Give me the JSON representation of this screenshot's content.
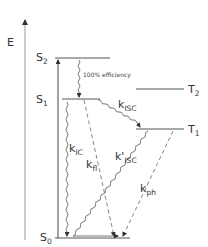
{
  "diagram": {
    "type": "jablonski",
    "axis": {
      "label": "E"
    },
    "states": [
      {
        "id": "S2",
        "main": "S",
        "sub": "2"
      },
      {
        "id": "S1",
        "main": "S",
        "sub": "1"
      },
      {
        "id": "S0",
        "main": "S",
        "sub": "0"
      },
      {
        "id": "T2",
        "main": "T",
        "sub": "2"
      },
      {
        "id": "T1",
        "main": "T",
        "sub": "1"
      }
    ],
    "transitions": {
      "s2_s1_note": "100% efficiency",
      "k_ic": {
        "main": "k",
        "sub": "IC"
      },
      "k_fl": {
        "main": "k",
        "sub": "fl"
      },
      "k_isc": {
        "main": "k",
        "sub": "ISC"
      },
      "k_prime_isc": {
        "main": "k'",
        "sub": "ISC"
      },
      "k_ph": {
        "main": "k",
        "sub": "ph"
      }
    },
    "colors": {
      "line": "#555555",
      "text": "#333333"
    }
  }
}
